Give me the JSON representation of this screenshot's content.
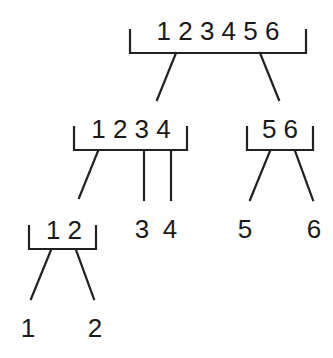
{
  "diagram": {
    "type": "merge-tree",
    "stroke_color": "#222222",
    "text_color": "#1a1a1a",
    "nodes": {
      "root": {
        "label": "1 2 3 4 5 6"
      },
      "left_internal": {
        "label": "1 2 3 4"
      },
      "right_internal": {
        "label": "5 6"
      },
      "left_left_internal": {
        "label": "1 2"
      },
      "leaf_3": {
        "label": "3"
      },
      "leaf_4": {
        "label": "4"
      },
      "leaf_5": {
        "label": "5"
      },
      "leaf_6": {
        "label": "6"
      },
      "leaf_1": {
        "label": "1"
      },
      "leaf_2": {
        "label": "2"
      }
    },
    "edges": [
      {
        "from": "1 2 3 4 5 6",
        "to": "1 2 3 4"
      },
      {
        "from": "1 2 3 4 5 6",
        "to": "5 6"
      },
      {
        "from": "1 2 3 4",
        "to": "1 2"
      },
      {
        "from": "1 2 3 4",
        "to": "3"
      },
      {
        "from": "1 2 3 4",
        "to": "4"
      },
      {
        "from": "5 6",
        "to": "5"
      },
      {
        "from": "5 6",
        "to": "6"
      },
      {
        "from": "1 2",
        "to": "1"
      },
      {
        "from": "1 2",
        "to": "2"
      }
    ]
  }
}
